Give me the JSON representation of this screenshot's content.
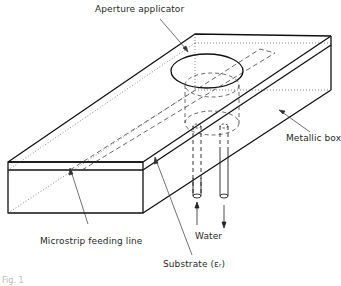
{
  "diagram": {
    "type": "technical-illustration",
    "labels": {
      "aperture_applicator": "Aperture applicator",
      "metallic_box": "Metallic box",
      "microstrip_feeding_line": "Microstrip feeding line",
      "water": "Water",
      "substrate": "Substrate (εᵣ)"
    },
    "caption": "Fig. 1"
  },
  "colors": {
    "line": "#111111",
    "leader": "#333333",
    "hidden": "#444444",
    "background": "#ffffff"
  }
}
